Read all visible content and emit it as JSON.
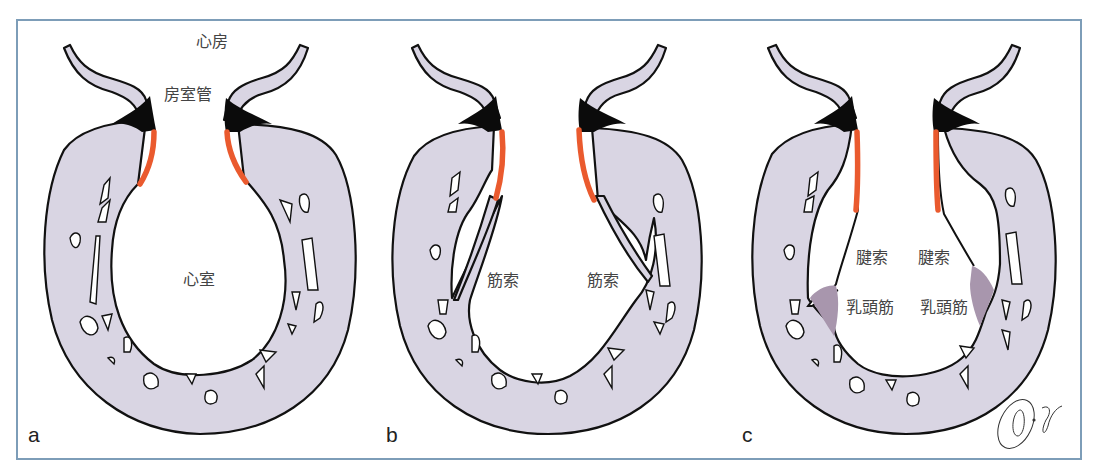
{
  "figure": {
    "frame_color": "#7d9db8",
    "colors": {
      "myocardium": "#d9d5e3",
      "endocardial_cushion": "#0b0b0b",
      "valve_leaflet": "#ea5a2e",
      "papillary_muscle": "#a896ad",
      "outline": "#111111"
    },
    "panels": [
      {
        "letter": "a",
        "labels": {
          "atrium": "心房",
          "av_canal": "房室管",
          "ventricle": "心室"
        }
      },
      {
        "letter": "b",
        "labels": {
          "muscle_cord_left": "筋索",
          "muscle_cord_right": "筋索"
        }
      },
      {
        "letter": "c",
        "labels": {
          "chordae_left": "腱索",
          "chordae_right": "腱索",
          "papillary_left": "乳頭筋",
          "papillary_right": "乳頭筋"
        }
      }
    ],
    "signature": "O. Jgausa"
  }
}
